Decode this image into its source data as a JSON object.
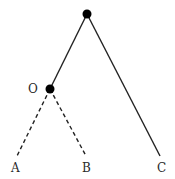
{
  "diagram": {
    "type": "tree",
    "colors": {
      "line": "#222222",
      "node": "#000000",
      "text": "#2a2a2a"
    },
    "nodes": [
      {
        "id": "root",
        "label": "",
        "x": 87,
        "y": 14
      },
      {
        "id": "O",
        "label": "O",
        "x": 50,
        "y": 89
      },
      {
        "id": "A",
        "label": "A",
        "x": 15,
        "y": 168
      },
      {
        "id": "B",
        "label": "B",
        "x": 86,
        "y": 168
      },
      {
        "id": "C",
        "label": "C",
        "x": 161,
        "y": 168
      }
    ],
    "edges": [
      {
        "from": "root",
        "to": "O",
        "style": "solid"
      },
      {
        "from": "root",
        "to": "C",
        "style": "solid"
      },
      {
        "from": "O",
        "to": "A",
        "style": "dashed"
      },
      {
        "from": "O",
        "to": "B",
        "style": "dashed"
      }
    ]
  }
}
